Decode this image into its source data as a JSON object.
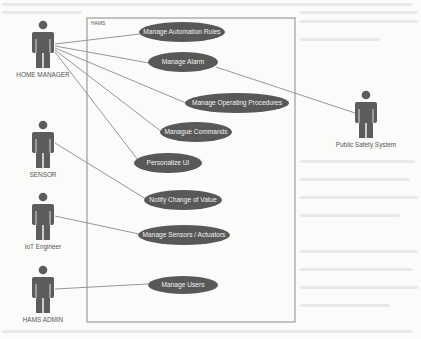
{
  "system": {
    "label": "HAMS",
    "box": {
      "x": 87,
      "y": 18,
      "w": 208,
      "h": 304
    }
  },
  "colors": {
    "usecase_fill": "#585858",
    "actor_fill": "#5c5c5c",
    "line": "#6a6a6a",
    "box_border": "#8a8a8a",
    "usecase_text": "#f2f2f2",
    "label_text": "#555555"
  },
  "actors": [
    {
      "id": "home-manager",
      "label": "HOME MANAGER",
      "cx": 43,
      "head_y": 25,
      "label_y": 77
    },
    {
      "id": "sensor",
      "label": "SENSOR",
      "cx": 43,
      "head_y": 125,
      "label_y": 177
    },
    {
      "id": "iot-engineer",
      "label": "IoT Engineer",
      "cx": 43,
      "head_y": 197,
      "label_y": 249
    },
    {
      "id": "hams-admin",
      "label": "HAMS ADMIN",
      "cx": 43,
      "head_y": 270,
      "label_y": 322
    },
    {
      "id": "public-safety-system",
      "label": "Public Safety System",
      "cx": 366,
      "head_y": 95,
      "label_y": 147
    }
  ],
  "usecases": [
    {
      "id": "manage-automation-rules",
      "label": "Manage Automation Rules",
      "cx": 182,
      "cy": 32,
      "rx": 43,
      "ry": 10
    },
    {
      "id": "manage-alarm",
      "label": "Manage Alarm",
      "cx": 183,
      "cy": 62,
      "rx": 35,
      "ry": 10
    },
    {
      "id": "manage-operating-procedures",
      "label": "Manage Operating Procedures",
      "cx": 237,
      "cy": 103,
      "rx": 52,
      "ry": 10
    },
    {
      "id": "manague-commands",
      "label": "Manague Commands",
      "cx": 196,
      "cy": 132,
      "rx": 36,
      "ry": 10
    },
    {
      "id": "personalize-ui",
      "label": "Personalize UI",
      "cx": 168,
      "cy": 163,
      "rx": 34,
      "ry": 10
    },
    {
      "id": "notify-change-of-value",
      "label": "Notify Change of Value",
      "cx": 183,
      "cy": 200,
      "rx": 39,
      "ry": 10
    },
    {
      "id": "manage-sensors-actuators",
      "label": "Manage Sensors / Actuators",
      "cx": 184,
      "cy": 235,
      "rx": 46,
      "ry": 10
    },
    {
      "id": "manage-users",
      "label": "Manage Users",
      "cx": 183,
      "cy": 285,
      "rx": 35,
      "ry": 9
    }
  ],
  "associations": [
    {
      "from": [
        55,
        44
      ],
      "to": [
        140,
        34
      ]
    },
    {
      "from": [
        55,
        46
      ],
      "to": [
        149,
        63
      ]
    },
    {
      "from": [
        55,
        48
      ],
      "to": [
        186,
        103
      ]
    },
    {
      "from": [
        55,
        50
      ],
      "to": [
        162,
        132
      ]
    },
    {
      "from": [
        55,
        52
      ],
      "to": [
        138,
        160
      ]
    },
    {
      "from": [
        55,
        143
      ],
      "to": [
        146,
        199
      ]
    },
    {
      "from": [
        55,
        216
      ],
      "to": [
        139,
        234
      ]
    },
    {
      "from": [
        55,
        289
      ],
      "to": [
        148,
        284
      ]
    },
    {
      "from": [
        216,
        67
      ],
      "to": [
        355,
        113
      ]
    }
  ]
}
